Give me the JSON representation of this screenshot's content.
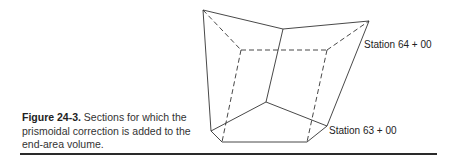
{
  "figure": {
    "number": "Figure 24-3.",
    "caption_text": " Sections for which the prismoidal correction is added to the end-area volume.",
    "labels": {
      "station_upper": "Station 64 + 00",
      "station_lower": "Station 63 + 00"
    },
    "line_color": "#333333"
  }
}
